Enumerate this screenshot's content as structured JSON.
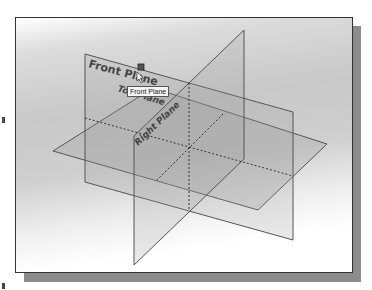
{
  "viewport": {
    "background_top": "#c8c8c8",
    "background_bottom": "#ffffff"
  },
  "planes": {
    "front": {
      "label": "Front Plane"
    },
    "top": {
      "label": "Top Plane"
    },
    "right": {
      "label": "Right Plane"
    }
  },
  "tooltip": {
    "text": "Front Plane"
  },
  "icons": {
    "selection_handle": "square-handle-icon",
    "cursor": "pointer-cursor-icon"
  },
  "colors": {
    "edge": "#555555",
    "plane_fill": "#9a9a9a",
    "label": "#444444",
    "frame": "#333333",
    "shadow": "#8c8c8c"
  }
}
